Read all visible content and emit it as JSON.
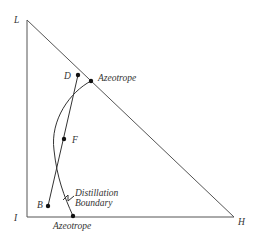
{
  "diagram": {
    "type": "ternary-distillation",
    "colors": {
      "background": "#ffffff",
      "edge": "#555555",
      "curve": "#333333",
      "dot": "#111111",
      "text": "#333333"
    },
    "vertices": {
      "L": {
        "label": "L",
        "x": 27,
        "y": 20
      },
      "I": {
        "label": "I",
        "x": 27,
        "y": 217
      },
      "H": {
        "label": "H",
        "x": 234,
        "y": 217
      }
    },
    "points": {
      "D": {
        "label": "D",
        "x": 78,
        "y": 75
      },
      "F": {
        "label": "F",
        "x": 64,
        "y": 139
      },
      "B": {
        "label": "B",
        "x": 48,
        "y": 206
      },
      "azeotrope_top": {
        "label": "Azeotrope",
        "x": 91,
        "y": 81
      },
      "azeotrope_bottom": {
        "label": "Azeotrope",
        "x": 73,
        "y": 216
      }
    },
    "annotations": {
      "boundary_line1": "Distillation",
      "boundary_line2": "Boundary"
    }
  }
}
